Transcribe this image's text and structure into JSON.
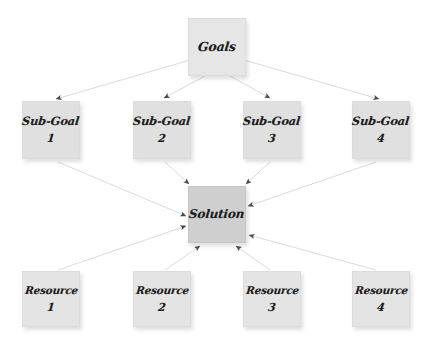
{
  "diagram": {
    "background_color": "#ffffff",
    "edge_color": "#d6d6d6",
    "arrowhead_color": "#4a4a4a",
    "node_fill": "#e2e2e2",
    "solution_fill": "#cfcfcf",
    "text_color": "#1c1c1c"
  },
  "nodes": {
    "goals": {
      "label": "Goals",
      "number": ""
    },
    "subgoals": [
      {
        "label": "Sub-Goal",
        "number": "1"
      },
      {
        "label": "Sub-Goal",
        "number": "2"
      },
      {
        "label": "Sub-Goal",
        "number": "3"
      },
      {
        "label": "Sub-Goal",
        "number": "4"
      }
    ],
    "solution": {
      "label": "Solution",
      "number": ""
    },
    "resources": [
      {
        "label": "Resource",
        "number": "1"
      },
      {
        "label": "Resource",
        "number": "2"
      },
      {
        "label": "Resource",
        "number": "3"
      },
      {
        "label": "Resource",
        "number": "4"
      }
    ]
  },
  "edges": [
    {
      "from": "goals",
      "to": "subgoal-1"
    },
    {
      "from": "goals",
      "to": "subgoal-2"
    },
    {
      "from": "goals",
      "to": "subgoal-3"
    },
    {
      "from": "goals",
      "to": "subgoal-4"
    },
    {
      "from": "subgoal-1",
      "to": "solution"
    },
    {
      "from": "subgoal-2",
      "to": "solution"
    },
    {
      "from": "subgoal-3",
      "to": "solution"
    },
    {
      "from": "subgoal-4",
      "to": "solution"
    },
    {
      "from": "resource-1",
      "to": "solution"
    },
    {
      "from": "resource-2",
      "to": "solution"
    },
    {
      "from": "resource-3",
      "to": "solution"
    },
    {
      "from": "resource-4",
      "to": "solution"
    }
  ]
}
